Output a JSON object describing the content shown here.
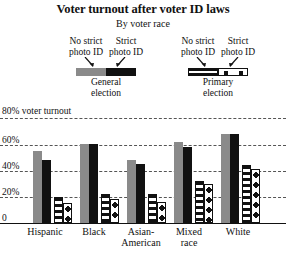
{
  "chart_data": {
    "type": "bar",
    "title": "Voter turnout after voter ID laws",
    "subtitle": "By voter race",
    "xlabel": "",
    "ylabel": "",
    "ylim": [
      0,
      80
    ],
    "grid": true,
    "yticks": [
      "0",
      "20%",
      "40%",
      "60%"
    ],
    "ytick_values": [
      0,
      20,
      40,
      60
    ],
    "top_annotation": "80% voter turnout",
    "top_annotation_value": 80,
    "categories": [
      "Hispanic",
      "Black",
      "Asian-American",
      "Mixed race",
      "White"
    ],
    "legend_position": "top",
    "legend_groups": [
      {
        "caption_line1": "General",
        "caption_line2": "election",
        "entries": [
          {
            "label_line1": "No strict",
            "label_line2": "photo ID",
            "swatch": "gray"
          },
          {
            "label_line1": "Strict",
            "label_line2": "photo ID",
            "swatch": "black"
          }
        ]
      },
      {
        "caption_line1": "Primary",
        "caption_line2": "election",
        "entries": [
          {
            "label_line1": "No strict",
            "label_line2": "photo ID",
            "swatch": "striped"
          },
          {
            "label_line1": "Strict",
            "label_line2": "photo ID",
            "swatch": "dotted"
          }
        ]
      }
    ],
    "series": [
      {
        "name": "General election, no strict photo ID",
        "swatch": "gray",
        "values": [
          55,
          60,
          48,
          62,
          68
        ]
      },
      {
        "name": "General election, strict photo ID",
        "swatch": "black",
        "values": [
          48,
          60,
          45,
          58,
          68
        ]
      },
      {
        "name": "Primary election, no strict photo ID",
        "swatch": "striped",
        "values": [
          20,
          22,
          22,
          32,
          44
        ]
      },
      {
        "name": "Primary election, strict photo ID",
        "swatch": "dotted",
        "values": [
          15,
          18,
          16,
          30,
          41
        ]
      }
    ]
  },
  "colors": {
    "gray": "#8a8a8a",
    "black": "#111111",
    "background": "#ffffff",
    "gridline": "#555555"
  }
}
